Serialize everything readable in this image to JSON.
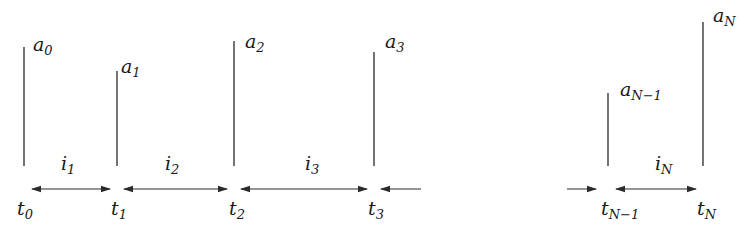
{
  "diagram": {
    "colors": {
      "line": "#2a2a2a",
      "text": "#1a1a1a",
      "background": "#ffffff"
    },
    "events": [
      {
        "time_label": "t",
        "time_sub": "0",
        "amp_label": "a",
        "amp_sub": "0",
        "x": 24,
        "top": 47
      },
      {
        "time_label": "t",
        "time_sub": "1",
        "amp_label": "a",
        "amp_sub": "1",
        "x": 117,
        "top": 71
      },
      {
        "time_label": "t",
        "time_sub": "2",
        "amp_label": "a",
        "amp_sub": "2",
        "x": 234,
        "top": 41
      },
      {
        "time_label": "t",
        "time_sub": "3",
        "amp_label": "a",
        "amp_sub": "3",
        "x": 374,
        "top": 52
      },
      {
        "time_label": "t",
        "time_sub": "N−1",
        "amp_label": "a",
        "amp_sub": "N−1",
        "x": 608,
        "top": 93
      },
      {
        "time_label": "t",
        "time_sub": "N",
        "amp_label": "a",
        "amp_sub": "N",
        "x": 703,
        "top": 22
      }
    ],
    "intervals": [
      {
        "label": "i",
        "sub": "1"
      },
      {
        "label": "i",
        "sub": "2"
      },
      {
        "label": "i",
        "sub": "3"
      },
      {
        "label": "i",
        "sub": "N"
      }
    ]
  }
}
